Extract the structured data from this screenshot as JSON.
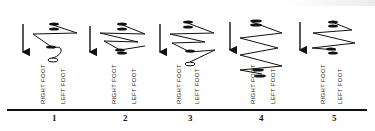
{
  "diagram": {
    "title": "",
    "stages": [
      {
        "number": "1",
        "right_label": "RIGHT FOOT",
        "left_label": "LEFT FOOT",
        "pattern": "zigzag-with-turn"
      },
      {
        "number": "2",
        "right_label": "RIGHT FOOT",
        "left_label": "LEFT FOOT",
        "pattern": "double-zigzag"
      },
      {
        "number": "3",
        "right_label": "RIGHT FOOT",
        "left_label": "LEFT FOOT",
        "pattern": "double-zigzag-with-turn"
      },
      {
        "number": "4",
        "right_label": "RIGHT FOOT",
        "left_label": "LEFT FOOT",
        "pattern": "long-zigzag"
      },
      {
        "number": "5",
        "right_label": "RIGHT FOOT",
        "left_label": "LEFT FOOT",
        "pattern": "short-zigzag"
      }
    ],
    "direction_icon": "down-arrow-icon",
    "colors": {
      "ink": "#111111",
      "background": "#ffffff"
    }
  }
}
